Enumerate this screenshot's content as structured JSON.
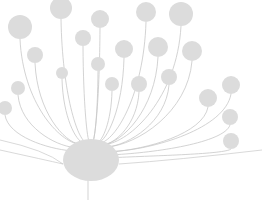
{
  "illustration": {
    "name": "dandelion-network",
    "background": "#ffffff",
    "node_color": "#dcdcdc",
    "stem_color": "#c8c8c8",
    "hub": {
      "cx": 91,
      "cy": 160,
      "rx": 28,
      "ry": 21
    },
    "tail": {
      "x1": 88,
      "y1": 180,
      "x2": 88,
      "y2": 200
    },
    "nodes": [
      {
        "cx": 61,
        "cy": 8,
        "r": 11
      },
      {
        "cx": 100,
        "cy": 19,
        "r": 9
      },
      {
        "cx": 146,
        "cy": 12,
        "r": 10
      },
      {
        "cx": 181,
        "cy": 14,
        "r": 12
      },
      {
        "cx": 20,
        "cy": 27,
        "r": 12
      },
      {
        "cx": 35,
        "cy": 55,
        "r": 8
      },
      {
        "cx": 83,
        "cy": 38,
        "r": 8
      },
      {
        "cx": 124,
        "cy": 49,
        "r": 9
      },
      {
        "cx": 158,
        "cy": 47,
        "r": 10
      },
      {
        "cx": 192,
        "cy": 51,
        "r": 10
      },
      {
        "cx": 62,
        "cy": 73,
        "r": 6
      },
      {
        "cx": 98,
        "cy": 64,
        "r": 7
      },
      {
        "cx": 112,
        "cy": 84,
        "r": 7
      },
      {
        "cx": 139,
        "cy": 84,
        "r": 8
      },
      {
        "cx": 169,
        "cy": 77,
        "r": 8
      },
      {
        "cx": 18,
        "cy": 88,
        "r": 7
      },
      {
        "cx": 5,
        "cy": 108,
        "r": 7
      },
      {
        "cx": 208,
        "cy": 98,
        "r": 9
      },
      {
        "cx": 231,
        "cy": 85,
        "r": 9
      },
      {
        "cx": 230,
        "cy": 117,
        "r": 8
      },
      {
        "cx": 231,
        "cy": 141,
        "r": 8
      }
    ]
  }
}
